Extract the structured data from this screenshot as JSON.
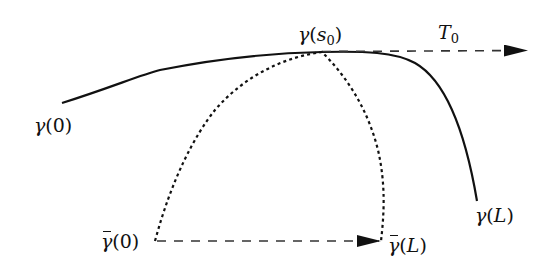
{
  "diagram": {
    "colors": {
      "stroke": "#111111",
      "background": "#ffffff"
    },
    "curves": {
      "gamma": {
        "style": "solid",
        "start": [
          62,
          103
        ],
        "peak": [
          322,
          52
        ],
        "end": [
          477,
          201
        ]
      },
      "gamma_bar": {
        "style": "dotted",
        "start": [
          155,
          241
        ],
        "peak": [
          322,
          52
        ],
        "end": [
          381,
          241
        ]
      }
    },
    "arrows": {
      "tangent": {
        "style": "dashed",
        "from": [
          322,
          52
        ],
        "to": [
          528,
          51
        ]
      },
      "base": {
        "style": "dashed",
        "from": [
          157,
          241
        ],
        "to": [
          381,
          241
        ]
      }
    },
    "labels": {
      "gamma_0": {
        "sym": "γ",
        "arg": "(0)"
      },
      "gamma_s0": {
        "sym": "γ",
        "open": "(",
        "var": "s",
        "sub": "0",
        "close": ")"
      },
      "tangent": {
        "sym": "T",
        "sub": "0"
      },
      "gamma_L": {
        "sym": "γ",
        "open": "(",
        "var": "L",
        "close": ")"
      },
      "gamma_bar_0": {
        "sym": "γ",
        "arg": "(0)"
      },
      "gamma_bar_L": {
        "sym": "γ",
        "open": "(",
        "var": "L",
        "close": ")"
      }
    }
  }
}
